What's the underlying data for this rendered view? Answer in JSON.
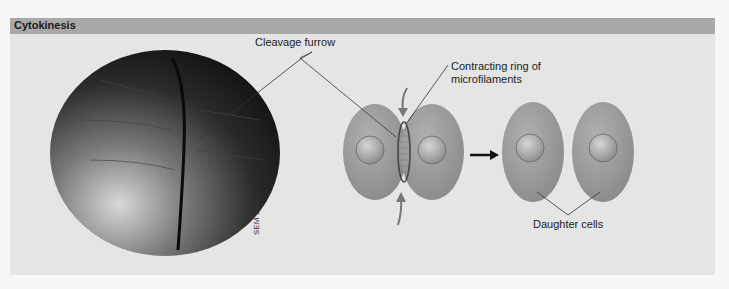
{
  "figure": {
    "title": "Cytokinesis",
    "labels": {
      "cleavage_furrow": "Cleavage furrow",
      "contracting_ring_line1": "Contracting ring of",
      "contracting_ring_line2": "microfilaments",
      "daughter_cells": "Daughter cells",
      "magnification": "SEM 113×"
    },
    "colors": {
      "header_bg": "#a9a9a9",
      "panel_bg": "#e5e5e5",
      "cell_fill": "#9a9a9a",
      "nucleus_fill": "#b8b8b8",
      "arrow": "#777777"
    }
  }
}
